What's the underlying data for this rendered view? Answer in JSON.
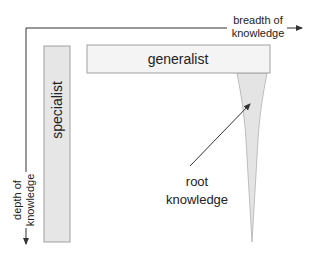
{
  "diagram": {
    "axes": {
      "x_label_line1": "breadth of",
      "x_label_line2": "knowledge",
      "y_label_line1": "depth of",
      "y_label_line2": "knowledge"
    },
    "boxes": {
      "generalist": "generalist",
      "specialist": "specialist"
    },
    "annotation": {
      "line1": "root",
      "line2": "knowledge"
    },
    "colors": {
      "line": "#333333",
      "box_fill": "#e6e6e6",
      "box_stroke": "#999999",
      "generalist_fill": "#f4f4f4",
      "funnel_fill": "#e4e4e4"
    }
  }
}
